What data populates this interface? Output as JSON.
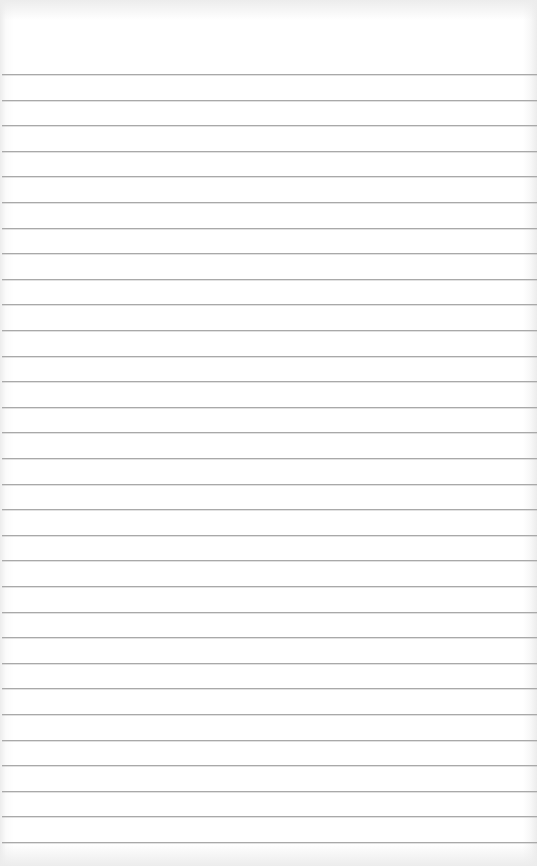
{
  "page": {
    "type": "lined-paper",
    "background_color": "#ffffff",
    "line_color": "#a9a9a9",
    "line_count": 31,
    "first_line_y": 74,
    "line_spacing": 25.6
  }
}
